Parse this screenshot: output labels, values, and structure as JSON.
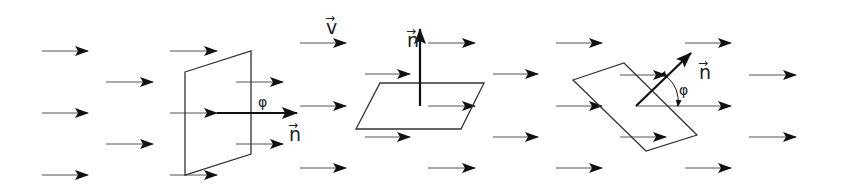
{
  "diagram": {
    "colors": {
      "line": "#333333",
      "arrow": "#111111",
      "background": "#ffffff"
    },
    "field_label": "v",
    "normal_label": "n",
    "angle_label": "φ",
    "panels": [
      {
        "id": "panel-1",
        "description": "surface perpendicular to field, normal parallel to v",
        "surface": [
          [
            185,
            72
          ],
          [
            251,
            51
          ],
          [
            251,
            154
          ],
          [
            185,
            175
          ]
        ],
        "normal": {
          "from": [
            217,
            113
          ],
          "to": [
            297,
            113
          ]
        },
        "normal_label_pos": [
          289,
          141
        ],
        "angle_label_pos": [
          258,
          107
        ],
        "arrows": [
          {
            "x1": 42,
            "y1": 51,
            "x2": 88,
            "y2": 51
          },
          {
            "x1": 42,
            "y1": 113,
            "x2": 88,
            "y2": 113
          },
          {
            "x1": 42,
            "y1": 175,
            "x2": 88,
            "y2": 175
          },
          {
            "x1": 106,
            "y1": 82,
            "x2": 153,
            "y2": 82
          },
          {
            "x1": 106,
            "y1": 144,
            "x2": 153,
            "y2": 144
          },
          {
            "x1": 170,
            "y1": 51,
            "x2": 217,
            "y2": 51
          },
          {
            "x1": 170,
            "y1": 113,
            "x2": 217,
            "y2": 113
          },
          {
            "x1": 170,
            "y1": 175,
            "x2": 217,
            "y2": 175
          },
          {
            "x1": 236,
            "y1": 82,
            "x2": 283,
            "y2": 82
          },
          {
            "x1": 236,
            "y1": 144,
            "x2": 283,
            "y2": 144
          }
        ]
      },
      {
        "id": "panel-2",
        "description": "surface parallel to field, normal perpendicular to v",
        "surface": [
          [
            380,
            83
          ],
          [
            484,
            83
          ],
          [
            461,
            129
          ],
          [
            356,
            129
          ]
        ],
        "normal": {
          "from": [
            420,
            106
          ],
          "to": [
            420,
            29
          ]
        },
        "normal_label_pos": [
          407,
          47
        ],
        "field_label_pos": [
          326,
          34
        ],
        "arrows": [
          {
            "x1": 300,
            "y1": 43,
            "x2": 346,
            "y2": 43
          },
          {
            "x1": 300,
            "y1": 106,
            "x2": 346,
            "y2": 106
          },
          {
            "x1": 300,
            "y1": 168,
            "x2": 346,
            "y2": 168
          },
          {
            "x1": 365,
            "y1": 74,
            "x2": 410,
            "y2": 74
          },
          {
            "x1": 365,
            "y1": 137,
            "x2": 410,
            "y2": 137
          },
          {
            "x1": 428,
            "y1": 43,
            "x2": 475,
            "y2": 43
          },
          {
            "x1": 428,
            "y1": 106,
            "x2": 475,
            "y2": 106
          },
          {
            "x1": 428,
            "y1": 168,
            "x2": 475,
            "y2": 168
          },
          {
            "x1": 493,
            "y1": 74,
            "x2": 538,
            "y2": 74
          },
          {
            "x1": 493,
            "y1": 137,
            "x2": 538,
            "y2": 137
          }
        ]
      },
      {
        "id": "panel-3",
        "description": "surface tilted, normal at angle phi to v",
        "surface": [
          [
            573,
            80
          ],
          [
            624,
            63
          ],
          [
            697,
            135
          ],
          [
            646,
            151
          ]
        ],
        "normal": {
          "from": [
            636,
            106
          ],
          "to": [
            691,
            53
          ]
        },
        "normal_label_pos": [
          699,
          79
        ],
        "angle_label_pos": [
          679,
          95
        ],
        "angle_arc": "M667,77 Q680,88 678,106",
        "arrows": [
          {
            "x1": 556,
            "y1": 43,
            "x2": 602,
            "y2": 43
          },
          {
            "x1": 556,
            "y1": 106,
            "x2": 602,
            "y2": 106
          },
          {
            "x1": 556,
            "y1": 168,
            "x2": 602,
            "y2": 168
          },
          {
            "x1": 620,
            "y1": 75,
            "x2": 666,
            "y2": 75
          },
          {
            "x1": 620,
            "y1": 137,
            "x2": 666,
            "y2": 137
          },
          {
            "x1": 636,
            "y1": 106,
            "x2": 731,
            "y2": 106
          },
          {
            "x1": 685,
            "y1": 43,
            "x2": 731,
            "y2": 43
          },
          {
            "x1": 685,
            "y1": 168,
            "x2": 731,
            "y2": 168
          },
          {
            "x1": 749,
            "y1": 75,
            "x2": 796,
            "y2": 75
          },
          {
            "x1": 749,
            "y1": 137,
            "x2": 796,
            "y2": 137
          }
        ]
      }
    ]
  }
}
